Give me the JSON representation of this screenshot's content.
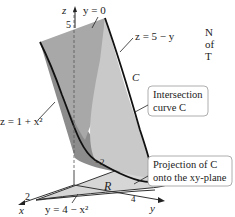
{
  "diagram": {
    "labels": {
      "z_axis": "z",
      "x_axis": "x",
      "y_axis": "y",
      "z_tick": "5",
      "x_tick": "2",
      "y_tick_neg": "−2",
      "y_tick_pos": "4",
      "plane_y0": "y = 0",
      "surface_plane": "z = 5 − y",
      "surface_parabolic": "z = 1 + x²",
      "curve_C": "C",
      "region_R": "R",
      "projection_curve": "y = 4 − x²"
    },
    "callouts": {
      "intersection_line1": "Intersection",
      "intersection_line2": "curve C",
      "projection_line1": "Projection of C",
      "projection_line2": "onto the xy-plane"
    },
    "colors": {
      "dark_surface": "#8c8c8c",
      "mid_surface": "#a8a8a8",
      "light_surface": "#c9c9c9",
      "region_fill": "#d6d6d6",
      "curve": "#111111"
    }
  },
  "side_text": {
    "line1": "N",
    "line2": "of",
    "line3": "T"
  }
}
